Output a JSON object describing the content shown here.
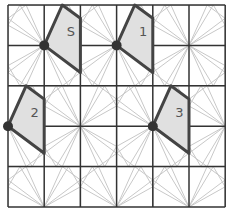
{
  "diagram": {
    "grid": {
      "cols": 6,
      "rows": 5,
      "x0": 8,
      "y0": 5,
      "cell_w": 36.2,
      "cell_h": 40.4
    },
    "colors": {
      "grid_line": "#333333",
      "guide_line": "#c8c8c8",
      "shape_fill": "#e0e0e0",
      "shape_stroke": "#444444",
      "dot": "#333333",
      "label": "#555555"
    },
    "star_centers": [
      [
        1,
        1
      ],
      [
        3,
        1
      ],
      [
        5,
        1
      ],
      [
        0,
        3
      ],
      [
        2,
        3
      ],
      [
        4,
        3
      ],
      [
        6,
        3
      ],
      [
        1,
        5
      ],
      [
        3,
        5
      ],
      [
        5,
        5
      ]
    ],
    "shapes": [
      {
        "label": "S",
        "pivot": [
          1,
          1
        ],
        "points": [
          [
            1,
            1
          ],
          [
            1.5,
            0
          ],
          [
            2,
            0.33
          ],
          [
            2,
            1.67
          ]
        ],
        "label_pos": [
          1.62,
          0.77
        ]
      },
      {
        "label": "1",
        "pivot": [
          3,
          1
        ],
        "points": [
          [
            3,
            1
          ],
          [
            3.5,
            0
          ],
          [
            4,
            0.33
          ],
          [
            4,
            1.67
          ]
        ],
        "label_pos": [
          3.62,
          0.77
        ]
      },
      {
        "label": "2",
        "pivot": [
          0,
          3
        ],
        "points": [
          [
            0,
            3
          ],
          [
            0.5,
            2
          ],
          [
            1,
            2.33
          ],
          [
            1,
            3.67
          ]
        ],
        "label_pos": [
          0.62,
          2.77
        ]
      },
      {
        "label": "3",
        "pivot": [
          4,
          3
        ],
        "points": [
          [
            4,
            3
          ],
          [
            4.5,
            2
          ],
          [
            5,
            2.33
          ],
          [
            5,
            3.67
          ]
        ],
        "label_pos": [
          4.62,
          2.77
        ]
      }
    ]
  }
}
